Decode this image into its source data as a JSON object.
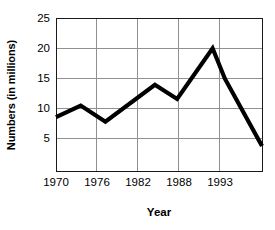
{
  "chart_data": {
    "type": "line",
    "title": "",
    "xlabel": "Year",
    "ylabel": "Numbers (in millions)",
    "xlim": [
      1970,
      1995
    ],
    "ylim": [
      2.3,
      25
    ],
    "xticks": [
      "1970",
      "1976",
      "1982",
      "1988",
      "1993"
    ],
    "xtick_values": [
      1970,
      1976,
      1982,
      1988,
      1993
    ],
    "yticks": [
      "5",
      "10",
      "15",
      "20",
      "25"
    ],
    "ytick_values": [
      5,
      10,
      15,
      20,
      25
    ],
    "grid": true,
    "legend": "none",
    "series": [
      {
        "name": "Numbers",
        "x": [
          1970,
          1973,
          1976,
          1982,
          1984.7,
          1989,
          1990.5,
          1995
        ],
        "values": [
          10.3,
          12.0,
          9.6,
          15.1,
          13.0,
          20.5,
          16.0,
          6.0
        ]
      }
    ],
    "line_color": "#000000",
    "grid_color": "#8c8c8c",
    "axis_color": "#1a1a1a"
  },
  "axis": {
    "y_title": "Numbers (in millions)",
    "x_title": "Year"
  }
}
